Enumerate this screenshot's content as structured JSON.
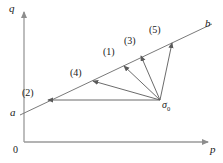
{
  "figure": {
    "axes": {
      "x_label": "p",
      "y_label": "q",
      "origin_label": "0"
    },
    "points": [
      {
        "id": "a",
        "label": "a",
        "x": 20,
        "y": 112
      },
      {
        "id": "b",
        "label": "b",
        "x": 205,
        "y": 25
      },
      {
        "id": "sigma0",
        "label": "σ",
        "subscript": "0",
        "x": 160,
        "y": 103
      }
    ],
    "failure_line": {
      "name": "failure-envelope-ab",
      "from": {
        "x": 20,
        "y": 113
      },
      "to": {
        "x": 212,
        "y": 24
      }
    },
    "paths": [
      {
        "id": "1",
        "label": "(1)",
        "label_x": 106,
        "label_y": 50,
        "tip_x": 123,
        "tip_y": 65,
        "tail_x": 160,
        "tail_y": 100
      },
      {
        "id": "2",
        "label": "(2)",
        "label_x": 24,
        "label_y": 92,
        "tip_x": 47,
        "tip_y": 100,
        "tail_x": 160,
        "tail_y": 100
      },
      {
        "id": "3",
        "label": "(3)",
        "label_x": 126,
        "label_y": 40,
        "tip_x": 140,
        "tip_y": 55,
        "tail_x": 160,
        "tail_y": 100
      },
      {
        "id": "4",
        "label": "(4)",
        "label_x": 72,
        "label_y": 72,
        "tip_x": 92,
        "tip_y": 80,
        "tail_x": 160,
        "tail_y": 100
      },
      {
        "id": "5",
        "label": "(5)",
        "label_x": 152,
        "label_y": 28,
        "tip_x": 172,
        "tip_y": 42,
        "tail_x": 160,
        "tail_y": 100
      }
    ],
    "caption": "",
    "colors": {
      "line": "#7a7a7a",
      "axis": "#9a9a9a",
      "text": "#1a1a1a"
    }
  }
}
